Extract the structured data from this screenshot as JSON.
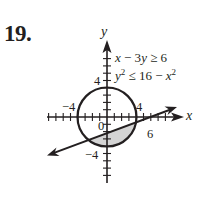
{
  "problem": {
    "number": "19."
  },
  "inequalities": [
    {
      "lhs": "x",
      "op": " − 3",
      "var": "y",
      "rel": " ≥ 6"
    },
    {
      "lhs": "y",
      "exp": "2",
      "rel": " ≤ 16 − ",
      "rhs": "x",
      "rhs_exp": "2"
    }
  ],
  "axes": {
    "x_label": "x",
    "y_label": "y",
    "tick_labels": {
      "x_neg": "−4",
      "x_pos": "4",
      "x_six": "6",
      "origin": "0",
      "y_pos": "4",
      "y_neg": "−4"
    }
  },
  "colors": {
    "ink": "#231f20",
    "shade": "#d4d4d4"
  },
  "figure_data": {
    "type": "inequality-graph",
    "circle": {
      "center": [
        0,
        0
      ],
      "radius": 4,
      "equation": "x^2 + y^2 = 16"
    },
    "line": {
      "equation": "x - 3y = 6",
      "slope": 0.3333,
      "y_intercept": -2,
      "x_intercept": 6
    },
    "shaded_region": "inside circle and below line x - 3y = 6",
    "x_range": [
      -8,
      9
    ],
    "y_range": [
      -8,
      8
    ]
  }
}
